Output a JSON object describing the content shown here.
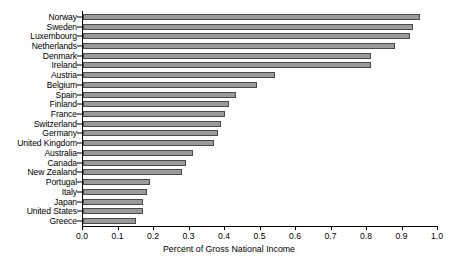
{
  "chart_data": {
    "type": "bar",
    "orientation": "horizontal",
    "title": "",
    "xlabel": "Percent of Gross National Income",
    "ylabel": "",
    "xlim": [
      0.0,
      1.0
    ],
    "xticks": [
      "0.0",
      "0.1",
      "0.2",
      "0.3",
      "0.4",
      "0.5",
      "0.6",
      "0.7",
      "0.8",
      "0.9",
      "1.0"
    ],
    "xtick_values": [
      0.0,
      0.1,
      0.2,
      0.3,
      0.4,
      0.5,
      0.6,
      0.7,
      0.8,
      0.9,
      1.0
    ],
    "grid": false,
    "legend": null,
    "bar_color": "#9a9a9a",
    "bar_edge_color": "#4a4a4a",
    "categories": [
      "Norway",
      "Sweden",
      "Luxembourg",
      "Netherlands",
      "Denmark",
      "Ireland",
      "Austria",
      "Belgium",
      "Spain",
      "Finland",
      "France",
      "Switzerland",
      "Germany",
      "United Kingdom",
      "Australia",
      "Canada",
      "New Zealand",
      "Portugal",
      "Italy",
      "Japan",
      "United States",
      "Greece"
    ],
    "values": [
      0.95,
      0.93,
      0.92,
      0.88,
      0.81,
      0.81,
      0.54,
      0.49,
      0.43,
      0.41,
      0.4,
      0.39,
      0.38,
      0.37,
      0.31,
      0.29,
      0.28,
      0.19,
      0.18,
      0.17,
      0.17,
      0.15
    ]
  }
}
